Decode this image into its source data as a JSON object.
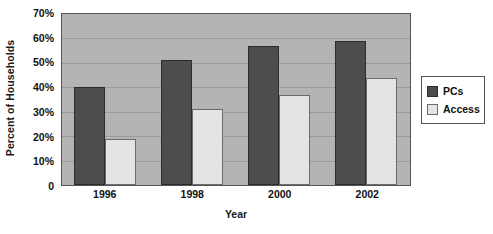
{
  "chart_data": {
    "type": "bar",
    "title": "",
    "xlabel": "Year",
    "ylabel": "Percent of Households",
    "categories": [
      "1996",
      "1998",
      "2000",
      "2002"
    ],
    "series": [
      {
        "name": "PCs",
        "color": "#4d4d4d",
        "values": [
          40,
          51,
          57,
          59
        ]
      },
      {
        "name": "Access",
        "color": "#e4e4e4",
        "values": [
          19,
          31,
          37,
          44
        ]
      }
    ],
    "ylim": [
      0,
      70
    ],
    "ytick_values": [
      0,
      10,
      20,
      30,
      40,
      50,
      60,
      70
    ],
    "ytick_labels": [
      "0",
      "10%",
      "20%",
      "30%",
      "40%",
      "50%",
      "60%",
      "70%"
    ],
    "grid": true,
    "grid_axis": "y",
    "legend_position": "right",
    "plot_background": "#b4b4b4",
    "figure_background": "#ffffff"
  }
}
